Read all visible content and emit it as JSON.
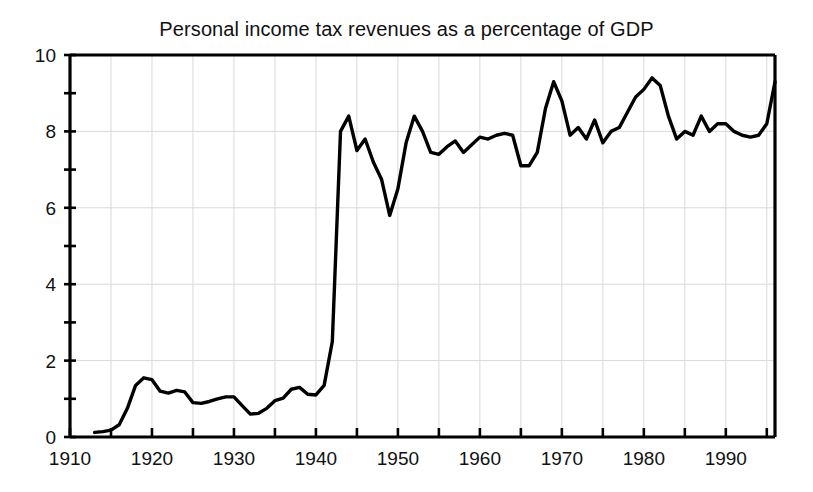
{
  "chart_data": {
    "type": "line",
    "title": "Personal income tax revenues as a percentage of GDP",
    "xlabel": "",
    "ylabel": "",
    "xlim": [
      1910,
      1996
    ],
    "ylim": [
      0,
      10
    ],
    "grid": true,
    "legend": null,
    "x_major_ticks": [
      1910,
      1920,
      1930,
      1940,
      1950,
      1960,
      1970,
      1980,
      1990
    ],
    "x_minor_ticks": [
      1915,
      1925,
      1935,
      1945,
      1955,
      1965,
      1975,
      1985,
      1995
    ],
    "x_tick_labels": [
      "1910",
      "1920",
      "1930",
      "1940",
      "1950",
      "1960",
      "1970",
      "1980",
      "1990"
    ],
    "y_major_ticks": [
      0,
      2,
      4,
      6,
      8,
      10
    ],
    "y_minor_ticks": [
      1,
      3,
      5,
      7,
      9
    ],
    "y_tick_labels": [
      "0",
      "2",
      "4",
      "6",
      "8",
      "10"
    ],
    "gridlines_x": [
      1915,
      1920,
      1925,
      1930,
      1935,
      1940,
      1945,
      1950,
      1955,
      1960,
      1965,
      1970,
      1975,
      1980,
      1985,
      1990,
      1995
    ],
    "gridlines_y": [
      2,
      4,
      6,
      8
    ],
    "line_color": "#000000",
    "grid_color": "#d9d9d9",
    "axis_color": "#000000",
    "series": [
      {
        "name": "Personal income tax revenues (% of GDP)",
        "x": [
          1913,
          1914,
          1915,
          1916,
          1917,
          1918,
          1919,
          1920,
          1921,
          1922,
          1923,
          1924,
          1925,
          1926,
          1927,
          1928,
          1929,
          1930,
          1931,
          1932,
          1933,
          1934,
          1935,
          1936,
          1937,
          1938,
          1939,
          1940,
          1941,
          1942,
          1943,
          1944,
          1945,
          1946,
          1947,
          1948,
          1949,
          1950,
          1951,
          1952,
          1953,
          1954,
          1955,
          1956,
          1957,
          1958,
          1959,
          1960,
          1961,
          1962,
          1963,
          1964,
          1965,
          1966,
          1967,
          1968,
          1969,
          1970,
          1971,
          1972,
          1973,
          1974,
          1975,
          1976,
          1977,
          1978,
          1979,
          1980,
          1981,
          1982,
          1983,
          1984,
          1985,
          1986,
          1987,
          1988,
          1989,
          1990,
          1991,
          1992,
          1993,
          1994,
          1995,
          1996
        ],
        "y": [
          0.12,
          0.14,
          0.18,
          0.32,
          0.75,
          1.35,
          1.55,
          1.5,
          1.2,
          1.15,
          1.22,
          1.18,
          0.9,
          0.88,
          0.93,
          1.0,
          1.05,
          1.05,
          0.82,
          0.6,
          0.62,
          0.75,
          0.95,
          1.02,
          1.25,
          1.3,
          1.12,
          1.1,
          1.35,
          2.5,
          8.0,
          8.4,
          7.5,
          7.8,
          7.2,
          6.75,
          5.8,
          6.5,
          7.7,
          8.4,
          8.0,
          7.45,
          7.4,
          7.6,
          7.75,
          7.45,
          7.65,
          7.85,
          7.8,
          7.9,
          7.95,
          7.9,
          7.1,
          7.1,
          7.45,
          8.6,
          9.3,
          8.8,
          7.9,
          8.1,
          7.8,
          8.3,
          7.7,
          8.0,
          8.1,
          8.5,
          8.9,
          9.1,
          9.4,
          9.2,
          8.4,
          7.8,
          8.0,
          7.9,
          8.4,
          8.0,
          8.2,
          8.2,
          8.0,
          7.9,
          7.85,
          7.9,
          8.2,
          9.3
        ]
      }
    ]
  }
}
